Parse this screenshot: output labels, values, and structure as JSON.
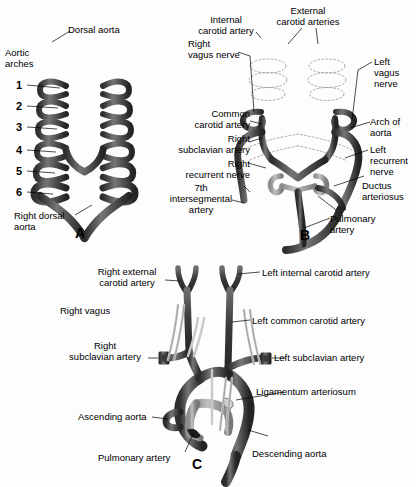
{
  "figure": {
    "background_color": "#fdfdfd",
    "vessel_dark_color": "#3a3a3a",
    "vessel_mid_color": "#6b6b6b",
    "vessel_light_color": "#a8a8a8",
    "nerve_color": "#d8d8d8",
    "outline_color": "#111111"
  },
  "panels": [
    {
      "letter": "A",
      "name": "primitive-aortic-arch-system",
      "labels": [
        {
          "id": "dorsal-aorta",
          "text": "Dorsal aorta"
        },
        {
          "id": "aortic-arches",
          "text": "Aortic\narches"
        },
        {
          "id": "right-dorsal-aorta",
          "text": "Right dorsal\naorta"
        }
      ],
      "arch_numbers": [
        "1",
        "2",
        "3",
        "4",
        "5",
        "6"
      ]
    },
    {
      "letter": "B",
      "name": "transforming-aortic-arches",
      "labels": [
        {
          "id": "internal-carotid-artery",
          "text": "Internal\ncarotid artery"
        },
        {
          "id": "external-carotid-arteries",
          "text": "External\ncarotid arteries"
        },
        {
          "id": "right-vagus-nerve",
          "text": "Right\nvagus nerve"
        },
        {
          "id": "left-vagus-nerve",
          "text": "Left\nvagus\nnerve"
        },
        {
          "id": "common-carotid-artery",
          "text": "Common\ncarotid artery"
        },
        {
          "id": "arch-of-aorta",
          "text": "Arch of\naorta"
        },
        {
          "id": "right-subclavian-artery",
          "text": "Right\nsubclavian artery"
        },
        {
          "id": "left-recurrent-nerve",
          "text": "Left\nrecurrent\nnerve"
        },
        {
          "id": "right-recurrent-nerve",
          "text": "Right\nrecurrent nerve"
        },
        {
          "id": "ductus-arteriosus",
          "text": "Ductus\narteriosus"
        },
        {
          "id": "seventh-intersegmental-artery",
          "text": "7th\nintersegmental\nartery"
        },
        {
          "id": "pulmonary-artery",
          "text": "Pulmonary\nartery"
        }
      ]
    },
    {
      "letter": "C",
      "name": "mature-aortic-arch",
      "labels": [
        {
          "id": "right-external-carotid-artery",
          "text": "Right external\ncarotid artery"
        },
        {
          "id": "left-internal-carotid-artery",
          "text": "Left internal carotid artery"
        },
        {
          "id": "right-vagus",
          "text": "Right vagus"
        },
        {
          "id": "left-common-carotid-artery",
          "text": "Left common carotid artery"
        },
        {
          "id": "right-subclavian-artery",
          "text": "Right\nsubclavian artery"
        },
        {
          "id": "left-subclavian-artery",
          "text": "Left subclavian artery"
        },
        {
          "id": "ligamentum-arteriosum",
          "text": "Ligamentum arteriosum"
        },
        {
          "id": "ascending-aorta",
          "text": "Ascending aorta"
        },
        {
          "id": "descending-aorta",
          "text": "Descending aorta"
        },
        {
          "id": "pulmonary-artery",
          "text": "Pulmonary artery"
        }
      ]
    }
  ]
}
